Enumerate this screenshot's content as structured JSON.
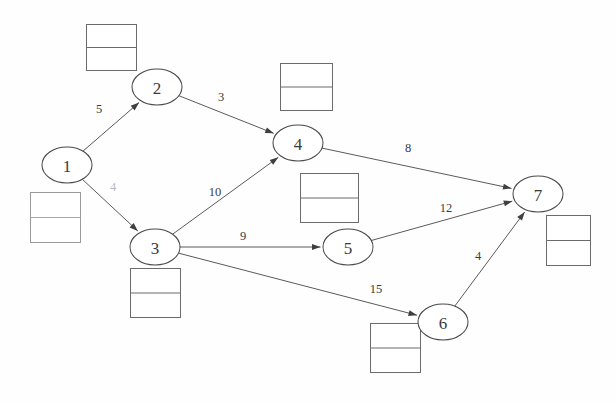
{
  "diagram": {
    "type": "node-link-diagram",
    "width": 616,
    "height": 402,
    "background_color": "#fefefe",
    "node_fill": "#ffffff",
    "node_stroke": "#4a4a4a",
    "edge_stroke": "#5a5a5a",
    "box_stroke": "#6b6b6b",
    "text_color": "#3b3b3b"
  },
  "nodes": [
    {
      "id": "1",
      "label": "1",
      "cx": 67,
      "cy": 165,
      "rx": 25,
      "ry": 18
    },
    {
      "id": "2",
      "label": "2",
      "cx": 157,
      "cy": 87,
      "rx": 25,
      "ry": 18
    },
    {
      "id": "3",
      "label": "3",
      "cx": 155,
      "cy": 247,
      "rx": 25,
      "ry": 18
    },
    {
      "id": "4",
      "label": "4",
      "cx": 298,
      "cy": 143,
      "rx": 25,
      "ry": 18
    },
    {
      "id": "5",
      "label": "5",
      "cx": 348,
      "cy": 247,
      "rx": 25,
      "ry": 18
    },
    {
      "id": "6",
      "label": "6",
      "cx": 443,
      "cy": 322,
      "rx": 25,
      "ry": 18
    },
    {
      "id": "7",
      "label": "7",
      "cx": 538,
      "cy": 194,
      "rx": 25,
      "ry": 18
    }
  ],
  "edges": [
    {
      "id": "e-1-2",
      "from": "1",
      "to": "2",
      "weight": "5",
      "wx": 99,
      "wy": 109,
      "faint": false
    },
    {
      "id": "e-1-3",
      "from": "1",
      "to": "3",
      "weight": "4",
      "wx": 113,
      "wy": 187,
      "faint": true
    },
    {
      "id": "e-2-4",
      "from": "2",
      "to": "4",
      "weight": "3",
      "wx": 221,
      "wy": 97,
      "faint": false
    },
    {
      "id": "e-3-4",
      "from": "3",
      "to": "4",
      "weight": "10",
      "wx": 215,
      "wy": 192,
      "faint": false
    },
    {
      "id": "e-3-5",
      "from": "3",
      "to": "5",
      "weight": "9",
      "wx": 243,
      "wy": 236,
      "faint": false
    },
    {
      "id": "e-3-6",
      "from": "3",
      "to": "6",
      "weight": "15",
      "wx": 376,
      "wy": 289,
      "faint": false
    },
    {
      "id": "e-4-7",
      "from": "4",
      "to": "7",
      "weight": "8",
      "wx": 408,
      "wy": 148,
      "faint": false
    },
    {
      "id": "e-5-7",
      "from": "5",
      "to": "7",
      "weight": "12",
      "wx": 446,
      "wy": 208,
      "faint": false
    },
    {
      "id": "e-6-7",
      "from": "6",
      "to": "7",
      "weight": "4",
      "wx": 478,
      "wy": 256,
      "faint": false
    }
  ],
  "label_boxes": [
    {
      "id": "box-node-2",
      "for_node": "2",
      "x": 86,
      "y": 24,
      "w": 50,
      "h": 46,
      "top_text": "",
      "bottom_text": "",
      "soft": false
    },
    {
      "id": "box-node-4",
      "for_node": "4",
      "x": 280,
      "y": 63,
      "w": 52,
      "h": 47,
      "top_text": "",
      "bottom_text": "",
      "soft": false
    },
    {
      "id": "box-node-1",
      "for_node": "1",
      "x": 30,
      "y": 192,
      "w": 50,
      "h": 50,
      "top_text": "",
      "bottom_text": "",
      "soft": true
    },
    {
      "id": "box-node-5",
      "for_node": "5",
      "x": 300,
      "y": 173,
      "w": 58,
      "h": 49,
      "top_text": "",
      "bottom_text": "",
      "soft": false
    },
    {
      "id": "box-node-7",
      "for_node": "7",
      "x": 546,
      "y": 215,
      "w": 44,
      "h": 50,
      "top_text": "",
      "bottom_text": "",
      "soft": false
    },
    {
      "id": "box-node-3",
      "for_node": "3",
      "x": 130,
      "y": 268,
      "w": 50,
      "h": 49,
      "top_text": "",
      "bottom_text": "",
      "soft": false
    },
    {
      "id": "box-node-6",
      "for_node": "6",
      "x": 370,
      "y": 323,
      "w": 50,
      "h": 49,
      "top_text": "",
      "bottom_text": "",
      "soft": false
    }
  ],
  "chart_data": {
    "type": "table",
    "columns": [
      "from",
      "to",
      "weight"
    ],
    "rows": [
      [
        "1",
        "2",
        5
      ],
      [
        "1",
        "3",
        4
      ],
      [
        "2",
        "4",
        3
      ],
      [
        "3",
        "4",
        10
      ],
      [
        "3",
        "5",
        9
      ],
      [
        "3",
        "6",
        15
      ],
      [
        "4",
        "7",
        8
      ],
      [
        "5",
        "7",
        12
      ],
      [
        "6",
        "7",
        4
      ]
    ],
    "node_ids": [
      "1",
      "2",
      "3",
      "4",
      "5",
      "6",
      "7"
    ],
    "source_node": "1",
    "sink_node": "7",
    "directed": true
  }
}
